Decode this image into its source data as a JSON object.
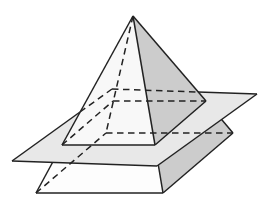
{
  "figure": {
    "name": "pyramid-intersected-by-parallel-plane",
    "canvas": {
      "width": 260,
      "height": 212,
      "background": "#ffffff"
    },
    "colors": {
      "outline": "#222222",
      "plane_fill": "#e8e8e8",
      "front_face": "#f8f8f8",
      "right_face": "#cccccc",
      "cross_section": "#b9b9b9",
      "frustum_front": "#fdfdfd"
    },
    "stroke": {
      "width": 1.5,
      "dash": "6.5,4.5"
    },
    "points": {
      "apex": [
        133,
        16
      ],
      "base_front_left": [
        36,
        193
      ],
      "base_front_right": [
        163,
        193
      ],
      "base_back_right": [
        233,
        133
      ],
      "base_back_left": [
        106,
        133
      ],
      "section_front_left": [
        62,
        145
      ],
      "section_front_right": [
        155,
        145
      ],
      "section_back_right": [
        206,
        101
      ],
      "section_back_left": [
        113,
        101
      ],
      "plane_left": [
        12,
        161
      ],
      "plane_back": [
        112,
        89
      ],
      "plane_right": [
        257,
        94
      ],
      "plane_front": [
        157,
        166
      ]
    },
    "layers": [
      {
        "type": "polygon",
        "name": "frustum-front-face",
        "points": [
          "base_front_left",
          "base_front_right",
          "section_front_right",
          "section_front_left"
        ],
        "fill": "frustum_front"
      },
      {
        "type": "polygon",
        "name": "frustum-right-face",
        "points": [
          "base_front_right",
          "base_back_right",
          "section_back_right",
          "section_front_right"
        ],
        "fill": "right_face"
      },
      {
        "type": "line",
        "name": "base-front-edge",
        "points": [
          "base_front_left",
          "base_front_right"
        ]
      },
      {
        "type": "line",
        "name": "base-right-edge",
        "points": [
          "base_front_right",
          "base_back_right"
        ]
      },
      {
        "type": "line",
        "name": "pyramid-left-edge-lower",
        "points": [
          "base_front_left",
          "section_front_left"
        ]
      },
      {
        "type": "line",
        "name": "pyramid-right-edge-lower",
        "points": [
          "base_front_right",
          "section_front_right"
        ]
      },
      {
        "type": "line",
        "name": "pyramid-back-right-edge-lower",
        "points": [
          "section_back_right",
          "base_back_right"
        ]
      },
      {
        "type": "polygon",
        "name": "plane-surface",
        "points": [
          "plane_left",
          "plane_back",
          "plane_right",
          "plane_front"
        ],
        "fill": "plane_fill"
      },
      {
        "type": "line",
        "name": "plane-left-back-edge-visible",
        "points": [
          "plane_left",
          [
            80,
            112
          ]
        ]
      },
      {
        "type": "line",
        "name": "plane-back-right-edge-visible",
        "points": [
          [
            198,
            92
          ],
          "plane_right"
        ]
      },
      {
        "type": "line",
        "name": "plane-front-left-edge",
        "points": [
          "plane_left",
          "plane_front"
        ]
      },
      {
        "type": "line",
        "name": "plane-front-right-edge",
        "points": [
          "plane_front",
          "plane_right"
        ]
      },
      {
        "type": "polygon",
        "name": "cross-section-face",
        "points": [
          "section_front_left",
          "section_front_right",
          "section_back_right",
          "section_back_left"
        ],
        "fill": "cross_section"
      },
      {
        "type": "polygon",
        "name": "upper-front-face",
        "points": [
          "apex",
          "section_front_left",
          "section_front_right"
        ],
        "fill": "front_face"
      },
      {
        "type": "polygon",
        "name": "upper-right-face",
        "points": [
          "apex",
          "section_front_right",
          "section_back_right"
        ],
        "fill": "right_face"
      },
      {
        "type": "line",
        "name": "pyramid-left-edge-upper",
        "points": [
          "apex",
          "section_front_left"
        ]
      },
      {
        "type": "line",
        "name": "pyramid-front-right-edge-upper",
        "points": [
          "apex",
          "section_front_right"
        ]
      },
      {
        "type": "line",
        "name": "pyramid-right-silhouette-upper",
        "points": [
          "apex",
          "section_back_right"
        ]
      },
      {
        "type": "line",
        "name": "cross-section-front-edge",
        "points": [
          "section_front_left",
          "section_front_right"
        ]
      },
      {
        "type": "line",
        "name": "cross-section-right-cut-edge",
        "points": [
          "section_front_right",
          "section_back_right"
        ]
      },
      {
        "type": "line",
        "name": "hidden-apex-back-edge",
        "points": [
          "apex",
          "base_back_left"
        ],
        "dashed": true
      },
      {
        "type": "line",
        "name": "hidden-base-back-edge",
        "points": [
          "base_back_left",
          "base_back_right"
        ],
        "dashed": true
      },
      {
        "type": "line",
        "name": "hidden-base-left-edge",
        "points": [
          "base_front_left",
          "base_back_left"
        ],
        "dashed": true
      },
      {
        "type": "line",
        "name": "hidden-cross-section-back-edge",
        "points": [
          "section_back_left",
          "section_back_right"
        ],
        "dashed": true
      },
      {
        "type": "line",
        "name": "hidden-cross-section-left-edge",
        "points": [
          "section_front_left",
          "section_back_left"
        ],
        "dashed": true
      },
      {
        "type": "line",
        "name": "hidden-plane-left-back-edge",
        "points": [
          [
            80,
            112
          ],
          "plane_back"
        ],
        "dashed": true
      },
      {
        "type": "line",
        "name": "hidden-plane-back-right-edge",
        "points": [
          "plane_back",
          [
            198,
            92
          ]
        ],
        "dashed": true
      }
    ]
  }
}
